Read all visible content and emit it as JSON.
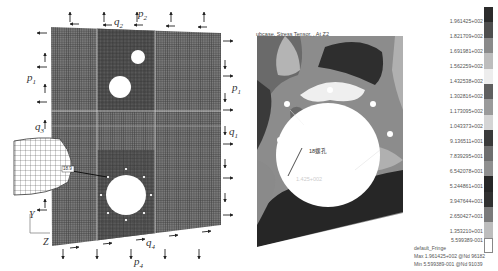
{
  "figure": {
    "left_panel": {
      "name": "finite-element-mesh-model",
      "load_labels": {
        "p1_left": "p",
        "p1_left_sub": "1",
        "p1_right": "p",
        "p1_right_sub": "1",
        "p2": "p",
        "p2_sub": "2",
        "q2": "q",
        "q2_sub": "2",
        "q3": "q",
        "q3_sub": "3",
        "q1": "q",
        "q1_sub": "1",
        "q4": "q",
        "q4_sub": "4",
        "p4": "p",
        "p4_sub": "4"
      },
      "axis_labels": {
        "y": "Y",
        "z": "Z"
      },
      "detail_label": "18.9"
    },
    "right_panel": {
      "name": "stress-contour-plot",
      "title": "ubcase, Stress Tensor, , At Z2",
      "hole_annotation": "18螺孔",
      "value_annotation": "1.425+002",
      "legend": {
        "values": [
          "1.961425+002",
          "1.821709+002",
          "1.691981+002",
          "1.562259+002",
          "1.432538+002",
          "1.302816+002",
          "1.173095+002",
          "1.043373+002",
          "9.136511+001",
          "7.839295+001",
          "6.542078+001",
          "5.244861+001",
          "3.947644+001",
          "2.650427+001",
          "1.353210+001",
          "5.599389-001"
        ],
        "colors": [
          "#2b2b2b",
          "#4e4e4e",
          "#8a8a8a",
          "#bdbdbd",
          "#ededed",
          "#5f5f5f",
          "#9a9a9a",
          "#d4d4d4",
          "#3a3a3a",
          "#6e6e6e",
          "#8f8f8f",
          "#262626",
          "#303030",
          "#7a7a7a",
          "#bdbdbd",
          "#ffffff"
        ],
        "fringe_name": "default_Fringe",
        "max_line": "Max 1.961425+002 @Nd 96182",
        "min_line": "Min 5.599389-001 @Nd 91039"
      }
    }
  }
}
